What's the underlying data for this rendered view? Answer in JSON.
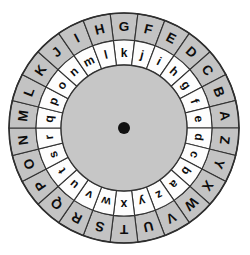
{
  "figure": {
    "name": "cipher-disc"
  },
  "geometry": {
    "center_x": 124,
    "center_y": 128,
    "radius_outer": 115,
    "radius_ring_divide": 88,
    "radius_inner": 63,
    "hub_pin_radius": 6,
    "segments": 26,
    "segment_degrees": 13.846,
    "outer_start_angle_deg": -6.923,
    "inner_start_angle_deg": -6.923
  },
  "colors": {
    "background": "#ffffff",
    "outer_ring_fill": "#c3c3c3",
    "inner_ring_fill": "#fdfdfd",
    "hub_fill": "#c6c6c6",
    "hub_pin": "#111111",
    "stroke": "#333333",
    "glyph": "#0d0d0d"
  },
  "rings": {
    "outer": {
      "name": "outer-alphabet-ring",
      "case": "uppercase",
      "direction": "clockwise-from-top",
      "letters": [
        "G",
        "F",
        "E",
        "D",
        "C",
        "B",
        "A",
        "Z",
        "Y",
        "X",
        "W",
        "V",
        "U",
        "T",
        "S",
        "R",
        "Q",
        "P",
        "O",
        "N",
        "M",
        "L",
        "K",
        "J",
        "I",
        "H"
      ]
    },
    "inner": {
      "name": "inner-alphabet-ring",
      "case": "lowercase",
      "direction": "clockwise-from-top",
      "letters": [
        "k",
        "j",
        "i",
        "h",
        "g",
        "f",
        "e",
        "d",
        "c",
        "b",
        "a",
        "z",
        "y",
        "x",
        "w",
        "v",
        "u",
        "t",
        "s",
        "r",
        "q",
        "p",
        "o",
        "n",
        "m",
        "l"
      ]
    }
  },
  "alignment": {
    "key_pair_label": "A ↔ e",
    "outer_reference": "A",
    "inner_reference": "e"
  }
}
